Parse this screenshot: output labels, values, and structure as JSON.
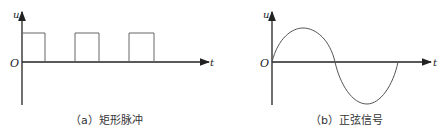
{
  "figure_a": {
    "y_label": "u",
    "x_label": "t",
    "origin_label": "O",
    "caption": "（a）矩形脉冲",
    "waveform": "rectangular-pulse",
    "pulses": [
      {
        "start": 22,
        "end": 45
      },
      {
        "start": 75,
        "end": 99
      },
      {
        "start": 129,
        "end": 154
      }
    ]
  },
  "figure_b": {
    "y_label": "u",
    "x_label": "t",
    "origin_label": "O",
    "caption": "（b）正弦信号",
    "waveform": "sine"
  },
  "colors": {
    "axis": "#222222",
    "waveform": "#555555",
    "background": "#ffffff"
  }
}
